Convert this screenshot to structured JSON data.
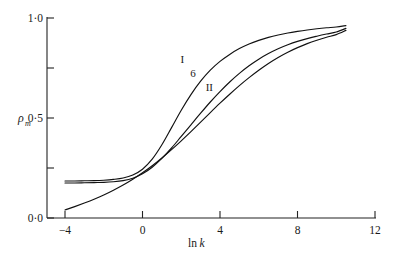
{
  "chart_data": {
    "type": "line",
    "title": "",
    "subtitle": "",
    "xlabel": "ln k",
    "ylabel": "ρm",
    "ylabel_base": "ρ",
    "ylabel_sub": "m",
    "xlim": [
      -4,
      12
    ],
    "ylim": [
      0.0,
      1.0
    ],
    "grid": false,
    "legend_position": "inline-annotations",
    "xticks": [
      -4,
      0,
      4,
      8,
      12
    ],
    "xtick_labels": [
      "−4",
      "0",
      "4",
      "8",
      "12"
    ],
    "yticks": [
      0.0,
      0.25,
      0.5,
      0.75,
      1.0
    ],
    "ytick_labels": [
      "0·0",
      "",
      "0·5",
      "",
      "1·0"
    ],
    "ytick_labels_shown": [
      "0·0",
      "0·5",
      "1·0"
    ],
    "line_color": "#111111",
    "axis_color": "#222222",
    "background": "#ffffff",
    "annotations": [
      {
        "text": "I",
        "x": 2.05,
        "y": 0.775
      },
      {
        "text": "6",
        "x": 2.6,
        "y": 0.705
      },
      {
        "text": "II",
        "x": 3.45,
        "y": 0.635
      }
    ],
    "series": [
      {
        "name": "I",
        "label": "I",
        "x": [
          -4.0,
          -3.5,
          -3.0,
          -2.5,
          -2.0,
          -1.5,
          -1.0,
          -0.5,
          0.0,
          0.5,
          1.0,
          1.5,
          2.0,
          2.5,
          3.0,
          3.5,
          4.0,
          4.5,
          5.0,
          5.5,
          6.0,
          6.5,
          7.0,
          7.5,
          8.0,
          8.5,
          9.0,
          9.5,
          10.0,
          10.5
        ],
        "y": [
          0.185,
          0.185,
          0.186,
          0.187,
          0.189,
          0.193,
          0.2,
          0.215,
          0.244,
          0.294,
          0.366,
          0.452,
          0.539,
          0.617,
          0.684,
          0.739,
          0.783,
          0.818,
          0.847,
          0.87,
          0.888,
          0.903,
          0.915,
          0.925,
          0.933,
          0.94,
          0.946,
          0.951,
          0.955,
          0.962
        ]
      },
      {
        "name": "6",
        "label": "6",
        "x": [
          -4.0,
          -3.5,
          -3.0,
          -2.5,
          -2.0,
          -1.5,
          -1.0,
          -0.5,
          0.0,
          0.5,
          1.0,
          1.5,
          2.0,
          2.5,
          3.0,
          3.5,
          4.0,
          4.5,
          5.0,
          5.5,
          6.0,
          6.5,
          7.0,
          7.5,
          8.0,
          8.5,
          9.0,
          9.5,
          10.0,
          10.5
        ],
        "y": [
          0.175,
          0.175,
          0.176,
          0.177,
          0.178,
          0.181,
          0.187,
          0.199,
          0.221,
          0.254,
          0.298,
          0.35,
          0.408,
          0.466,
          0.524,
          0.58,
          0.632,
          0.68,
          0.723,
          0.761,
          0.794,
          0.822,
          0.846,
          0.866,
          0.883,
          0.897,
          0.909,
          0.92,
          0.93,
          0.948
        ]
      },
      {
        "name": "II",
        "label": "II",
        "x": [
          -4.0,
          -3.5,
          -3.0,
          -2.5,
          -2.0,
          -1.5,
          -1.0,
          -0.5,
          0.0,
          0.5,
          1.0,
          1.5,
          2.0,
          2.5,
          3.0,
          3.5,
          4.0,
          4.5,
          5.0,
          5.5,
          6.0,
          6.5,
          7.0,
          7.5,
          8.0,
          8.5,
          9.0,
          9.5,
          10.0,
          10.5
        ],
        "y": [
          0.04,
          0.057,
          0.075,
          0.094,
          0.115,
          0.139,
          0.165,
          0.194,
          0.226,
          0.261,
          0.3,
          0.342,
          0.386,
          0.432,
          0.479,
          0.527,
          0.574,
          0.619,
          0.662,
          0.702,
          0.739,
          0.773,
          0.803,
          0.829,
          0.852,
          0.872,
          0.889,
          0.904,
          0.917,
          0.938
        ]
      }
    ]
  },
  "axes": {
    "x_axis_name": "ln k",
    "x_axis_prefix": "ln",
    "x_axis_var": "k",
    "y_axis_name": "ρm"
  }
}
